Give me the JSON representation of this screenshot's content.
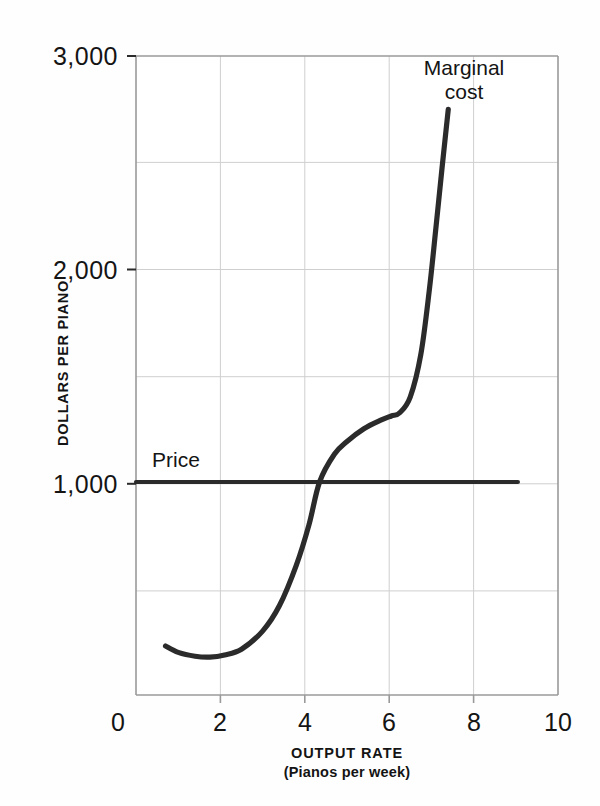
{
  "chart_data": {
    "type": "line",
    "title": "",
    "xlabel": "OUTPUT RATE",
    "xlabel_sub": "(Pianos per week)",
    "ylabel": "DOLLARS PER PIANO",
    "xlim": [
      0,
      10
    ],
    "ylim": [
      0,
      3000
    ],
    "xticks": [
      "0",
      "2",
      "4",
      "6",
      "8",
      "10"
    ],
    "xtick_values": [
      0,
      2,
      4,
      6,
      8,
      10
    ],
    "yticks": [
      "1,000",
      "2,000",
      "3,000"
    ],
    "ytick_values": [
      1000,
      2000,
      3000
    ],
    "grid": true,
    "grid_x_step": 2,
    "grid_y_step": 500,
    "legend_position": "inline-annotations",
    "series": [
      {
        "name": "Marginal cost",
        "annotation_line1": "Marginal",
        "annotation_line2": "cost",
        "color": "#2b2b2b",
        "x": [
          0.7,
          1.0,
          1.4,
          1.75,
          2.1,
          2.5,
          3.0,
          3.4,
          3.8,
          4.1,
          4.35,
          4.7,
          5.0,
          5.4,
          5.8,
          6.05,
          6.25,
          6.5,
          6.75,
          6.95,
          7.1,
          7.25,
          7.4
        ],
        "y": [
          230,
          200,
          182,
          178,
          188,
          215,
          300,
          420,
          610,
          800,
          1000,
          1130,
          1190,
          1250,
          1290,
          1310,
          1325,
          1400,
          1600,
          1900,
          2180,
          2470,
          2750
        ]
      },
      {
        "name": "Price",
        "annotation_line1": "Price",
        "annotation_line2": "",
        "color": "#2b2b2b",
        "x": [
          0.0,
          9.05
        ],
        "y": [
          1000,
          1000
        ]
      }
    ],
    "intersection": {
      "x": 4.35,
      "y": 1000
    },
    "colors": {
      "curve": "#2b2b2b",
      "grid": "#cfcfcf",
      "axis": "#9a9a9a",
      "text": "#141414",
      "background": "#fefefe"
    }
  }
}
